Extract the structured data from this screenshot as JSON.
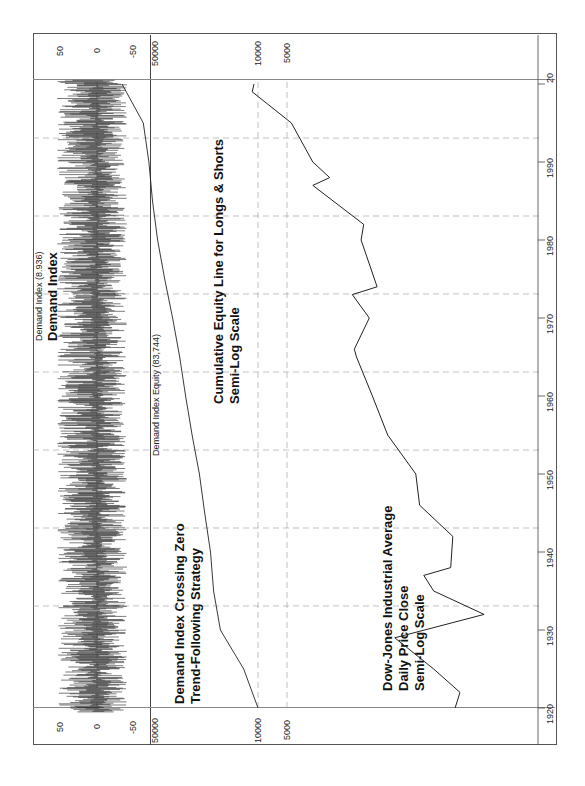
{
  "chart_data": [
    {
      "type": "bar",
      "name": "demand-index-panel",
      "title": "Demand Index",
      "legend": "Demand Index (8.936)",
      "yticks": [
        50,
        0,
        -50
      ],
      "ylim": [
        -70,
        70
      ],
      "x_range": [
        1919,
        2001
      ],
      "description": "Oscillator fluctuating around zero roughly between -50 and +50 throughout 1920-2000"
    },
    {
      "type": "line",
      "name": "equity-panel",
      "title": "Cumulative Equity Line for Longs & Shorts",
      "subtitle": "Semi-Log Scale",
      "annotation": [
        "Demand Index Crossing Zero",
        "Trend-Following Strategy"
      ],
      "legend": "Demand Index Equity (83,744)",
      "yscale": "log",
      "yticks": [
        50000,
        10000
      ],
      "x": [
        1920,
        1925,
        1930,
        1935,
        1940,
        1945,
        1950,
        1955,
        1960,
        1965,
        1970,
        1975,
        1980,
        1985,
        1990,
        1995,
        2000
      ],
      "values": [
        10000,
        12500,
        18000,
        20000,
        21000,
        23000,
        25000,
        28000,
        31000,
        34000,
        38000,
        43000,
        48000,
        52000,
        55000,
        60000,
        83744
      ]
    },
    {
      "type": "line",
      "name": "djia-panel",
      "title": "Dow-Jones Industrial Average",
      "subtitle": [
        "Daily Price Close",
        "Semi-Log Scale"
      ],
      "yscale": "log",
      "yticks": [
        10000,
        5000
      ],
      "x": [
        1920,
        1922,
        1925,
        1929,
        1932,
        1935,
        1937,
        1938,
        1942,
        1946,
        1950,
        1955,
        1960,
        1965,
        1966,
        1970,
        1973,
        1974,
        1980,
        1982,
        1987,
        1988,
        1990,
        1995,
        1999,
        2000
      ],
      "values": [
        90,
        80,
        150,
        380,
        45,
        150,
        190,
        100,
        95,
        210,
        230,
        450,
        650,
        950,
        1000,
        700,
        1050,
        580,
        850,
        800,
        2700,
        1800,
        2700,
        4500,
        11500,
        11000
      ]
    }
  ],
  "xaxis": {
    "ticks": [
      "1920",
      "1930",
      "1940",
      "1950",
      "1960",
      "1970",
      "1980",
      "1990",
      "20"
    ],
    "xlim": [
      1915,
      2003
    ]
  },
  "labels": {
    "di_legend": "Demand Index (8.936)",
    "di_title": "Demand Index",
    "di_tick_50": "50",
    "di_tick_0": "0",
    "di_tick_m50": "-50",
    "eq_legend": "Demand Index Equity (83,744)",
    "eq_title_1": "Cumulative Equity Line for Longs & Shorts",
    "eq_title_2": "Semi-Log Scale",
    "strategy_1": "Demand Index Crossing Zero",
    "strategy_2": "Trend-Following Strategy",
    "eq_tick_50000": "50000",
    "eq_tick_10000": "10000",
    "dj_tick_10000": "10000",
    "dj_tick_5000": "5000",
    "dj_title_1": "Dow-Jones Industrial Average",
    "dj_title_2": "Daily Price Close",
    "dj_title_3": "Semi-Log Scale"
  }
}
